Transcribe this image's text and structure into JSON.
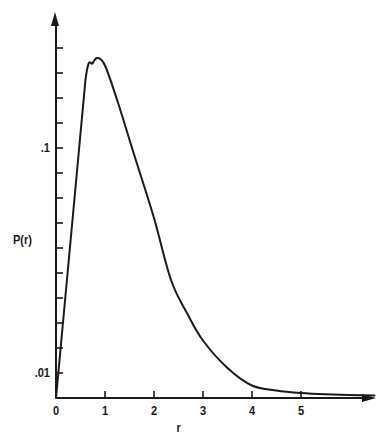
{
  "chart_data": {
    "type": "line",
    "title": "",
    "xlabel": "r",
    "ylabel": "P(r)",
    "x_ticks": [
      "0",
      "1",
      "2",
      "3",
      "4",
      "5"
    ],
    "y_tick_labels": [
      ".01",
      ".1"
    ],
    "y_tick_values": [
      0.01,
      0.1
    ],
    "y_minor_tick_step": 0.01,
    "xlim": [
      0,
      6.5
    ],
    "ylim": [
      0,
      0.145
    ],
    "grid": false,
    "legend": null,
    "series": [
      {
        "name": "P(r)",
        "x": [
          0,
          0.3,
          0.6,
          0.75,
          0.85,
          1.0,
          1.25,
          1.6,
          2.0,
          2.35,
          2.7,
          3.0,
          3.5,
          4.0,
          4.5,
          5.0,
          5.5,
          6.5
        ],
        "values": [
          0,
          0.064,
          0.127,
          0.134,
          0.136,
          0.133,
          0.119,
          0.097,
          0.072,
          0.047,
          0.033,
          0.023,
          0.012,
          0.005,
          0.003,
          0.002,
          0.0015,
          0.001
        ]
      }
    ],
    "line_color": "#1a1a1a"
  },
  "axes": {
    "y_label": "P(r)",
    "x_label": "r"
  }
}
